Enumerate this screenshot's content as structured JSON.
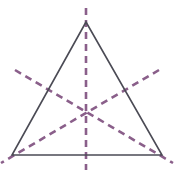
{
  "figure": {
    "kind": "geometry-diagram",
    "background_color": "#ffffff",
    "width": 174,
    "height": 177
  },
  "chart_data": {
    "type": "scatter",
    "xlabel": "",
    "ylabel": "",
    "grid": false,
    "legend": "none",
    "xlim": [
      0,
      174
    ],
    "ylim": [
      177,
      0
    ],
    "annotations": [
      "Solid dark-gray equilateral triangle outline",
      "Three dashed purple lines of symmetry (medians / altitudes) meeting at the centroid",
      "Each dashed line extends slightly past the triangle on both ends"
    ]
  },
  "shapes": {
    "triangle": {
      "name": "equilateral-triangle",
      "stroke_color": "#4b4b55",
      "stroke_width": 1.6,
      "fill": "none",
      "vertices": [
        {
          "label": "apex",
          "x": 86,
          "y": 22
        },
        {
          "label": "bottom-right",
          "x": 162,
          "y": 155
        },
        {
          "label": "bottom-left",
          "x": 12,
          "y": 155
        }
      ]
    },
    "centroid": {
      "x": 86.7,
      "y": 110.7
    },
    "symmetry_lines": [
      {
        "name": "vertical-axis",
        "description": "Altitude from apex to midpoint of base",
        "stroke_color": "#8a5f8a",
        "stroke_width": 2.6,
        "dash": "7 5",
        "x1": 86,
        "y1": 8,
        "x2": 86,
        "y2": 170
      },
      {
        "name": "left-diagonal-axis",
        "description": "Altitude from bottom-right vertex to midpoint of left side",
        "stroke_color": "#8a5f8a",
        "stroke_width": 2.6,
        "dash": "7 5",
        "x1": 15,
        "y1": 70,
        "x2": 173,
        "y2": 163
      },
      {
        "name": "right-diagonal-axis",
        "description": "Altitude from bottom-left vertex to midpoint of right side",
        "stroke_color": "#8a5f8a",
        "stroke_width": 2.6,
        "dash": "7 5",
        "x1": 159,
        "y1": 70,
        "x2": 1,
        "y2": 163
      }
    ]
  }
}
